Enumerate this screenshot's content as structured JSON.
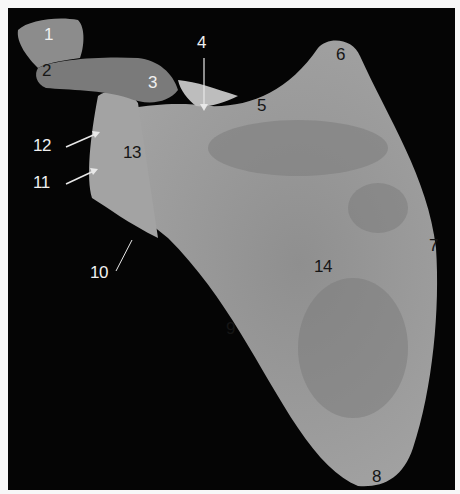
{
  "figure": {
    "background_color": "#050505",
    "border_color": "#f7f7f7",
    "bone_color": "#9a9a9a"
  },
  "labels": [
    {
      "id": "1",
      "text": "1",
      "x": 44,
      "y": 26,
      "tone": "light"
    },
    {
      "id": "2",
      "text": "2",
      "x": 42,
      "y": 62,
      "tone": "dark"
    },
    {
      "id": "3",
      "text": "3",
      "x": 148,
      "y": 74,
      "tone": "light"
    },
    {
      "id": "4",
      "text": "4",
      "x": 197,
      "y": 34,
      "tone": "light"
    },
    {
      "id": "5",
      "text": "5",
      "x": 257,
      "y": 97,
      "tone": "dark"
    },
    {
      "id": "6",
      "text": "6",
      "x": 336,
      "y": 46,
      "tone": "dark"
    },
    {
      "id": "7",
      "text": "7",
      "x": 429,
      "y": 237,
      "tone": "dark"
    },
    {
      "id": "8",
      "text": "8",
      "x": 372,
      "y": 468,
      "tone": "dark"
    },
    {
      "id": "9",
      "text": "9",
      "x": 226,
      "y": 320,
      "tone": "dark"
    },
    {
      "id": "10",
      "text": "10",
      "x": 90,
      "y": 264,
      "tone": "light"
    },
    {
      "id": "11",
      "text": "11",
      "x": 33,
      "y": 174,
      "tone": "light"
    },
    {
      "id": "12",
      "text": "12",
      "x": 33,
      "y": 137,
      "tone": "light"
    },
    {
      "id": "13",
      "text": "13",
      "x": 123,
      "y": 144,
      "tone": "dark"
    },
    {
      "id": "14",
      "text": "14",
      "x": 314,
      "y": 258,
      "tone": "dark"
    }
  ]
}
